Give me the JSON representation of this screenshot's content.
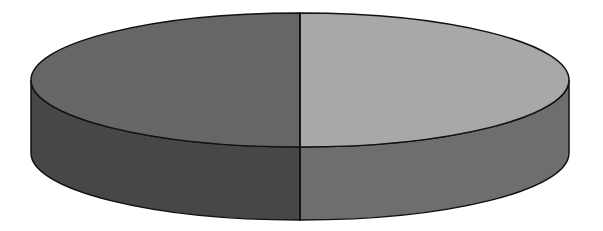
{
  "chart_data": {
    "type": "pie",
    "style": "3d",
    "title": "",
    "categories": [
      "Slice A",
      "Slice B"
    ],
    "values": [
      50,
      50
    ],
    "legend": "none",
    "labels_shown": false,
    "colors": {
      "left_top": "#666666",
      "left_side": "#474747",
      "right_top": "#a8a8a8",
      "right_side": "#6e6e6e",
      "outline": "#111111"
    },
    "geometry": {
      "cx": 300,
      "cy_top": 80,
      "rx": 269,
      "ry": 67,
      "depth": 73
    }
  }
}
